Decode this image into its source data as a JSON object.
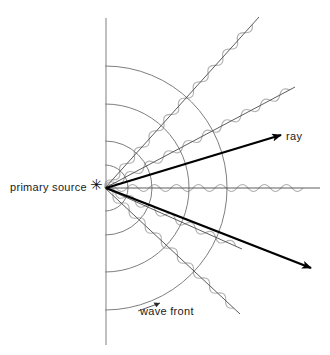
{
  "figure": {
    "background_color": "#ffffff",
    "width": 330,
    "height": 355
  },
  "labels": {
    "primary_source": "primary source",
    "ray": "ray",
    "wave_front": "wave front",
    "source_marker_glyph": "✳"
  },
  "colors": {
    "wave_gray": "#b0b0b0",
    "arc_gray": "#6f6f6f",
    "thin_ray": "#4a4a4a",
    "thick_ray": "#000000",
    "axis_line": "#8a8a8a",
    "text": "#1a1a1a"
  },
  "geometry": {
    "source": {
      "x": 105,
      "y": 188
    },
    "vertical_line": {
      "x": 106,
      "y_top": 18,
      "y_bottom": 345
    },
    "wave_fronts": {
      "description": "concentric circular arcs centred on the primary source",
      "radii": [
        23,
        47,
        84,
        122
      ],
      "count": 4
    },
    "rays": [
      {
        "name": "ray-up-steep",
        "angle_deg": -48,
        "length": 230,
        "weight": "thin",
        "wave": true,
        "arrow": false
      },
      {
        "name": "ray-up-shallow",
        "angle_deg": -28,
        "length": 215,
        "weight": "thin",
        "wave": true,
        "arrow": false
      },
      {
        "name": "ray-horizontal",
        "angle_deg": 0,
        "length": 215,
        "weight": "thin",
        "wave": true,
        "arrow": false
      },
      {
        "name": "ray-down-shallow",
        "angle_deg": 24,
        "length": 150,
        "weight": "thin",
        "wave": true,
        "arrow": false
      },
      {
        "name": "ray-down-steep",
        "angle_deg": 43,
        "length": 185,
        "weight": "thin",
        "wave": true,
        "arrow": false
      },
      {
        "name": "ray-arrow-upper",
        "angle_deg": -17,
        "length": 183,
        "weight": "thick",
        "wave": false,
        "arrow": true
      },
      {
        "name": "ray-arrow-lower",
        "angle_deg": 21,
        "length": 220,
        "weight": "thick",
        "wave": false,
        "arrow": true
      }
    ],
    "wave": {
      "wavelength": 22,
      "amplitude": 7
    },
    "wave_front_leader": {
      "from": {
        "x": 178,
        "y": 312
      },
      "to": {
        "x": 139,
        "y": 300
      }
    }
  }
}
